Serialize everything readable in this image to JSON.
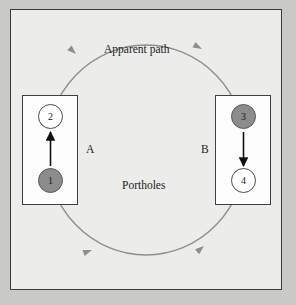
{
  "figure": {
    "title_label": "Apparent path",
    "portholes_label": "Portholes",
    "background_color": "#c9c9c7",
    "panel_color": "#ececeb",
    "frame_color": "#3a3a3a"
  },
  "path": {
    "name": "Apparent path",
    "shape": "ellipse",
    "direction": "counterclockwise",
    "stroke_color": "#8e8e8e",
    "arrow_markers": 4
  },
  "portholes": [
    {
      "id": "A",
      "label": "A",
      "box_side": "left",
      "arrow_direction": "up",
      "nodes": [
        {
          "label": "2",
          "fill": "hollow",
          "position": "top",
          "color": "#ffffff"
        },
        {
          "label": "1",
          "fill": "filled",
          "position": "bottom",
          "color": "#8c8c8c"
        }
      ]
    },
    {
      "id": "B",
      "label": "B",
      "box_side": "right",
      "arrow_direction": "down",
      "nodes": [
        {
          "label": "3",
          "fill": "filled",
          "position": "top",
          "color": "#8c8c8c"
        },
        {
          "label": "4",
          "fill": "hollow",
          "position": "bottom",
          "color": "#ffffff"
        }
      ]
    }
  ]
}
